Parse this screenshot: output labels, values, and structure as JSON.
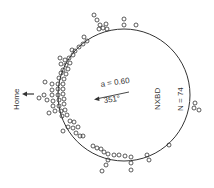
{
  "diagram": {
    "type": "circular-orientation-plot",
    "home_label": "Home",
    "mean_vector_label": "a = 0.60",
    "mean_angle_label": "351°",
    "group_label": "NXBD",
    "n_label": "N = 74",
    "colors": {
      "ink": "#333333",
      "background": "#ffffff"
    }
  }
}
